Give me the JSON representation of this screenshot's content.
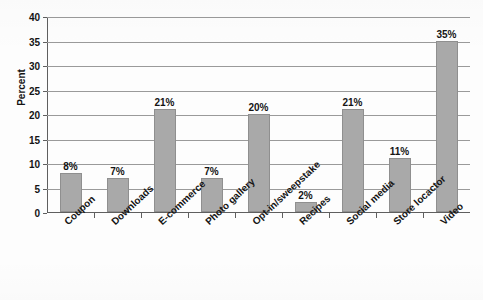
{
  "chart_data": {
    "type": "bar",
    "title": "",
    "xlabel": "",
    "ylabel": "Percent",
    "categories": [
      "Coupon",
      "Downloads",
      "E-commerce",
      "Photo gallery",
      "Opt-in/sweepstake",
      "Recipes",
      "Social media",
      "Store locactor",
      "Video"
    ],
    "values": [
      8,
      7,
      21,
      7,
      20,
      2,
      21,
      11,
      35
    ],
    "value_labels": [
      "8%",
      "7%",
      "21%",
      "7%",
      "20%",
      "2%",
      "21%",
      "11%",
      "35%"
    ],
    "ylim": [
      0,
      40
    ],
    "ytick_values": [
      0,
      5,
      10,
      15,
      20,
      25,
      30,
      35,
      40
    ],
    "ytick_labels": [
      "0",
      "5",
      "10",
      "15",
      "20",
      "25",
      "30",
      "35",
      "40"
    ],
    "grid": true,
    "grid_axis": "y",
    "legend": false,
    "legend_position": "none",
    "bar_color": "#a9a9a9",
    "bar_edge_color": "#8f8f8f",
    "axis_color": "#5f5f5f",
    "gridline_color": "#9a9a9a",
    "text_color": "#141414",
    "background_color": "#fdfdfd"
  }
}
